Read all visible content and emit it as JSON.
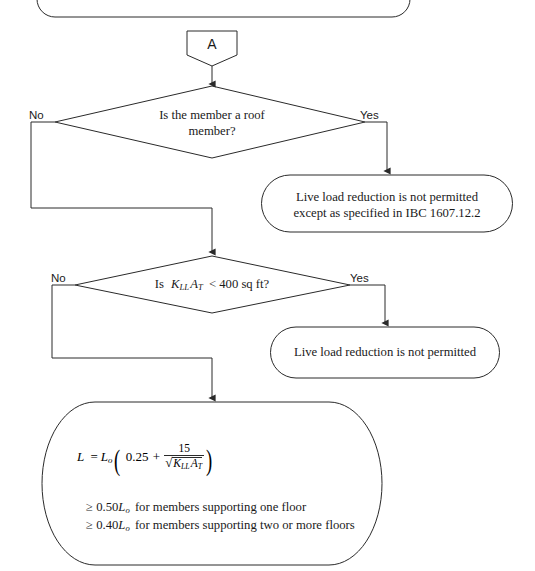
{
  "diagram": {
    "stroke_color": "#2a2a2a",
    "text_color": "#1a1a1a",
    "background": "#ffffff"
  },
  "connector": {
    "label": "A"
  },
  "decision_roof": {
    "line1": "Is the member a roof",
    "line2": "member?",
    "no_label": "No",
    "yes_label": "Yes"
  },
  "result_roof": {
    "line1": "Live load reduction is not permitted",
    "line2": "except as specified in IBC 1607.12.2"
  },
  "decision_area": {
    "prefix": "Is",
    "k_symbol": "K",
    "k_subscript": "LL",
    "a_symbol": "A",
    "a_subscript": "T",
    "comparison": "< 400  sq ft?",
    "full_text": "Is K_LL A_T < 400 sq ft?",
    "no_label": "No",
    "yes_label": "Yes"
  },
  "result_area": {
    "line1": "Live load reduction is not permitted"
  },
  "formula_box": {
    "equation": {
      "lhs": "L",
      "equals": "=",
      "lo_symbol": "L",
      "lo_subscript": "o",
      "open_paren": "(",
      "constant": "0.25",
      "plus": "+",
      "numerator": "15",
      "denominator_k": "K",
      "denominator_k_sub": "LL",
      "denominator_a": "A",
      "denominator_a_sub": "T",
      "close_paren": ")",
      "plain": "L = Lo(0.25 + 15 / sqrt(KLL AT))"
    },
    "note1": {
      "symbol": "≥",
      "coefficient": "0.50",
      "var": "L",
      "var_sub": "o",
      "text": "for members supporting one floor"
    },
    "note2": {
      "symbol": "≥",
      "coefficient": "0.40",
      "var": "L",
      "var_sub": "o",
      "text": "for members supporting two or more floors"
    }
  }
}
